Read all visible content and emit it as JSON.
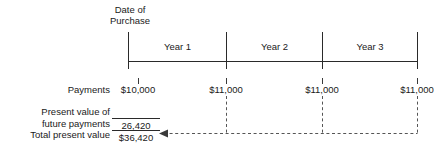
{
  "diagram": {
    "title_caption": {
      "line1": "Date of",
      "line2": "Purchase"
    },
    "timeline": {
      "segments": [
        {
          "label": "Year 1"
        },
        {
          "label": "Year 2"
        },
        {
          "label": "Year 3"
        }
      ],
      "tick_count": 4
    },
    "payments": {
      "row_label": "Payments",
      "amounts": [
        "$10,000",
        "$11,000",
        "$11,000",
        "$11,000"
      ]
    },
    "summary": {
      "pv_label_line1": "Present value of",
      "pv_label_line2": "future payments",
      "pv_value": "26,420",
      "total_label": "Total present value",
      "total_value": "$36,420"
    },
    "colors": {
      "ink": "#1a1a1a",
      "rule": "#2a2a2a",
      "dash": "#555555",
      "background": "#ffffff"
    }
  }
}
